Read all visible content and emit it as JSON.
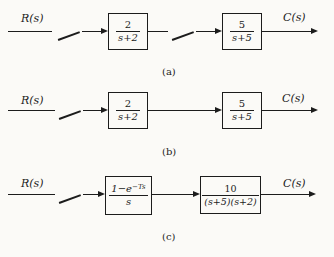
{
  "figure": {
    "colors": {
      "ink": "#1c1c1c",
      "background": "#fbfaf7"
    },
    "diagrams": [
      {
        "caption": "(a)",
        "input_label": "R(s)",
        "output_label": "C(s)",
        "samplers": 2,
        "blocks": [
          {
            "num": "2",
            "den": "s+2"
          },
          {
            "num": "5",
            "den": "s+5"
          }
        ]
      },
      {
        "caption": "(b)",
        "input_label": "R(s)",
        "output_label": "C(s)",
        "samplers": 1,
        "blocks": [
          {
            "num": "2",
            "den": "s+2"
          },
          {
            "num": "5",
            "den": "s+5"
          }
        ]
      },
      {
        "caption": "(c)",
        "input_label": "R(s)",
        "output_label": "C(s)",
        "samplers": 1,
        "blocks": [
          {
            "num_base": "1−e",
            "num_sup": "−Ts",
            "den": "s"
          },
          {
            "num": "10",
            "den": "(s+5)(s+2)"
          }
        ]
      }
    ]
  }
}
